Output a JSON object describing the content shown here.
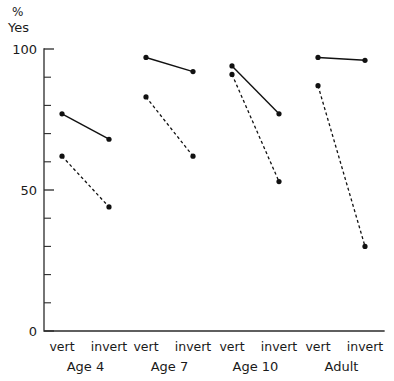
{
  "chart_data": {
    "type": "line",
    "title": "",
    "subtitle": "",
    "ylabel_line1": "%",
    "ylabel_line2": "Yes",
    "xlabel": "",
    "ylim": [
      0,
      100
    ],
    "ytick_labels": [
      "100",
      "50",
      "0"
    ],
    "ytick_values": [
      100,
      50,
      0
    ],
    "yminor_step": 10,
    "grid": false,
    "legend": "none",
    "x_conditions": [
      "vert",
      "invert"
    ],
    "groups": [
      "Age 4",
      "Age 7",
      "Age 10",
      "Adult"
    ],
    "series": [
      {
        "name": "solid",
        "style": "solid",
        "marker": "filled-circle",
        "values": [
          [
            77,
            68
          ],
          [
            97,
            92
          ],
          [
            94,
            77
          ],
          [
            97,
            96
          ]
        ]
      },
      {
        "name": "dashed",
        "style": "dashed",
        "marker": "filled-circle",
        "values": [
          [
            62,
            44
          ],
          [
            83,
            62
          ],
          [
            91,
            53
          ],
          [
            87,
            30
          ]
        ]
      }
    ]
  },
  "axis": {
    "y_unit": "%",
    "y_name": "Yes"
  },
  "colors": {
    "ink": "#111111",
    "axis": "#2b2b2b",
    "background": "#ffffff"
  }
}
